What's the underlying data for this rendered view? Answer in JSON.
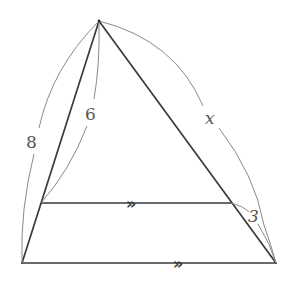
{
  "diagram": {
    "type": "similar-triangles",
    "points": {
      "apex": [
        99,
        21
      ],
      "bottom_left": [
        22,
        263
      ],
      "bottom_right": [
        276,
        263
      ],
      "inner_left": [
        41,
        203
      ],
      "inner_right": [
        231,
        203
      ]
    },
    "labels": {
      "outer_left_side": "8",
      "inner_left_side": "6",
      "right_side_upper": "x",
      "right_side_lower": "3"
    },
    "parallel_marker": "»",
    "colors": {
      "line": "#3a3a3a",
      "arc": "#8a8a8a",
      "text": "#555555"
    }
  }
}
